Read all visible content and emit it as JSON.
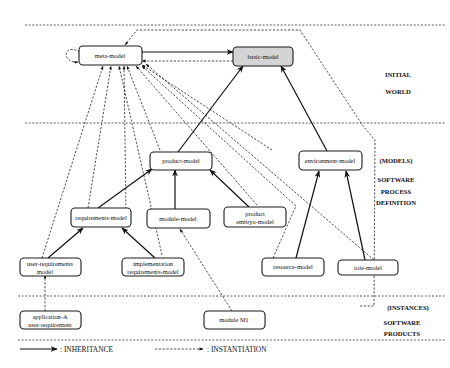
{
  "diagram": {
    "layers": [
      {
        "id": "initial",
        "lines": [
          "INITIAL",
          "WORLD"
        ]
      },
      {
        "id": "models",
        "lines": [
          "(MODELS)",
          "SOFTWARE",
          "PROCESS",
          "DEFINITION"
        ]
      },
      {
        "id": "instances",
        "lines": [
          "(INSTANCES)",
          "SOFTWARE",
          "PRODUCTS"
        ]
      }
    ],
    "nodes": [
      {
        "id": "meta-model",
        "lines": [
          "meta-model"
        ],
        "shaded": false
      },
      {
        "id": "basic-model",
        "lines": [
          "basic-model"
        ],
        "shaded": true
      },
      {
        "id": "product-model",
        "lines": [
          "product-model"
        ],
        "shaded": false
      },
      {
        "id": "environment-model",
        "lines": [
          "environment-model"
        ],
        "shaded": false
      },
      {
        "id": "requirements-model",
        "lines": [
          "requirements-model"
        ],
        "shaded": false
      },
      {
        "id": "module-model",
        "lines": [
          "module-model"
        ],
        "shaded": false
      },
      {
        "id": "product-embryo-model",
        "lines": [
          "product",
          "embryo-model"
        ],
        "shaded": false
      },
      {
        "id": "user-requirements-model",
        "lines": [
          "user-requirements",
          "model"
        ],
        "shaded": false
      },
      {
        "id": "implementation-requirements-model",
        "lines": [
          "implementation",
          "requirements-model"
        ],
        "shaded": false
      },
      {
        "id": "resource-model",
        "lines": [
          "resource-model"
        ],
        "shaded": false
      },
      {
        "id": "role-model",
        "lines": [
          "role-model"
        ],
        "shaded": false
      },
      {
        "id": "application-a-user-requirement",
        "lines": [
          "application-A",
          "user-requirement"
        ],
        "shaded": false
      },
      {
        "id": "module-m1",
        "lines": [
          "module M1"
        ],
        "shaded": false
      }
    ],
    "inheritance_edges": [
      {
        "from": "meta-model",
        "to": "basic-model"
      },
      {
        "from": "product-model",
        "to": "basic-model"
      },
      {
        "from": "environment-model",
        "to": "basic-model"
      },
      {
        "from": "requirements-model",
        "to": "product-model"
      },
      {
        "from": "module-model",
        "to": "product-model"
      },
      {
        "from": "product-embryo-model",
        "to": "product-model"
      },
      {
        "from": "user-requirements-model",
        "to": "requirements-model"
      },
      {
        "from": "implementation-requirements-model",
        "to": "requirements-model"
      },
      {
        "from": "resource-model",
        "to": "environment-model"
      },
      {
        "from": "role-model",
        "to": "environment-model"
      }
    ],
    "instantiation_edges": [
      {
        "from": "meta-model",
        "to": "meta-model"
      },
      {
        "from": "basic-model",
        "to": "meta-model"
      },
      {
        "from": "product-model",
        "to": "meta-model"
      },
      {
        "from": "environment-model",
        "to": "meta-model"
      },
      {
        "from": "requirements-model",
        "to": "meta-model"
      },
      {
        "from": "module-model",
        "to": "meta-model"
      },
      {
        "from": "product-embryo-model",
        "to": "meta-model"
      },
      {
        "from": "user-requirements-model",
        "to": "meta-model"
      },
      {
        "from": "implementation-requirements-model",
        "to": "meta-model"
      },
      {
        "from": "resource-model",
        "to": "meta-model"
      },
      {
        "from": "role-model",
        "to": "meta-model"
      },
      {
        "from": "application-a-user-requirement",
        "to": "user-requirements-model"
      },
      {
        "from": "module-m1",
        "to": "module-model"
      }
    ],
    "legend": {
      "inheritance": ": INHERITANCE",
      "instantiation": ": INSTANTIATION"
    }
  }
}
